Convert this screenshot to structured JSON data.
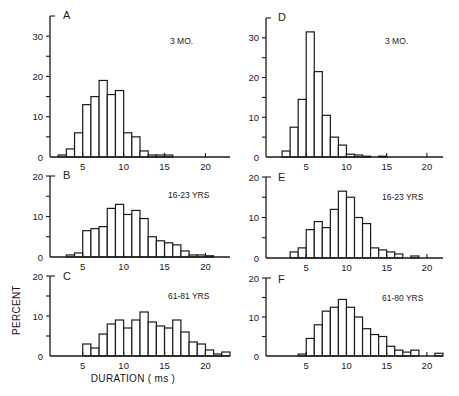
{
  "chart_data": [
    {
      "type": "bar",
      "panel": "A",
      "label": "3 MO.",
      "bin_width": 1,
      "bin_starts": [
        2,
        3,
        4,
        5,
        6,
        7,
        8,
        9,
        10,
        11,
        12,
        13,
        14,
        15
      ],
      "values": [
        0.5,
        2,
        6,
        13,
        15,
        19,
        15.5,
        16.5,
        6,
        5,
        1.5,
        0.5,
        0.5,
        0.5
      ],
      "xlim": [
        1,
        23
      ],
      "ylim": [
        0,
        35
      ],
      "xticks": [
        5,
        10,
        15,
        20
      ],
      "yticks": [
        0,
        10,
        20,
        30
      ],
      "yminor": [
        5,
        15,
        25
      ]
    },
    {
      "type": "bar",
      "panel": "B",
      "label": "16-23 YRS",
      "bin_width": 1,
      "bin_starts": [
        3,
        4,
        5,
        6,
        7,
        8,
        9,
        10,
        11,
        12,
        13,
        14,
        15,
        16,
        17,
        18,
        19,
        20
      ],
      "values": [
        0.5,
        1,
        6.5,
        7,
        7.5,
        12,
        13,
        10.5,
        11.5,
        9.5,
        5,
        4,
        3.5,
        3,
        1.5,
        0.5,
        0.5,
        0.3
      ],
      "xlim": [
        1,
        23
      ],
      "ylim": [
        0,
        20
      ],
      "xticks": [
        5,
        10,
        15,
        20
      ],
      "yticks": [
        0,
        10,
        20
      ],
      "yminor": [
        5,
        15
      ]
    },
    {
      "type": "bar",
      "panel": "C",
      "label": "61-81 YRS",
      "bin_width": 1,
      "bin_starts": [
        5,
        6,
        7,
        8,
        9,
        10,
        11,
        12,
        13,
        14,
        15,
        16,
        17,
        18,
        19,
        20,
        21,
        22
      ],
      "values": [
        3,
        2,
        5.5,
        8,
        9,
        7,
        9,
        11,
        8.5,
        7.5,
        7,
        9,
        6,
        3.5,
        3,
        1.5,
        0.5,
        1
      ],
      "xlim": [
        1,
        23
      ],
      "ylim": [
        0,
        20
      ],
      "xticks": [
        5,
        10,
        15,
        20
      ],
      "yticks": [
        0,
        10,
        20
      ],
      "yminor": [
        5,
        15
      ]
    },
    {
      "type": "bar",
      "panel": "D",
      "label": "3 MO.",
      "bin_width": 1,
      "bin_starts": [
        2,
        3,
        4,
        5,
        6,
        7,
        8,
        9,
        10,
        11,
        12,
        14
      ],
      "values": [
        1.5,
        7.5,
        14.5,
        31.5,
        21.5,
        10.5,
        5,
        3,
        0.7,
        0.5,
        0.2,
        0.2
      ],
      "xlim": [
        0,
        22
      ],
      "ylim": [
        0,
        35
      ],
      "xticks": [
        5,
        10,
        15,
        20
      ],
      "yticks": [
        0,
        10,
        20,
        30
      ],
      "yminor": [
        5,
        15,
        25
      ]
    },
    {
      "type": "bar",
      "panel": "E",
      "label": "16-23 YRS",
      "bin_width": 1,
      "bin_starts": [
        3,
        4,
        5,
        6,
        7,
        8,
        9,
        10,
        11,
        12,
        13,
        14,
        15,
        16,
        18
      ],
      "values": [
        1.5,
        2.5,
        7,
        9,
        7.5,
        12,
        16.5,
        15,
        10,
        8.5,
        2.5,
        2,
        1.5,
        1,
        0.5
      ],
      "xlim": [
        0,
        22
      ],
      "ylim": [
        0,
        20
      ],
      "xticks": [
        5,
        10,
        15,
        20
      ],
      "yticks": [
        0,
        10,
        20
      ],
      "yminor": [
        5,
        15
      ]
    },
    {
      "type": "bar",
      "panel": "F",
      "label": "61-80 YRS",
      "bin_width": 1,
      "bin_starts": [
        4,
        5,
        6,
        7,
        8,
        9,
        10,
        11,
        12,
        13,
        14,
        15,
        16,
        17,
        18,
        21
      ],
      "values": [
        0.5,
        4.5,
        8,
        11.5,
        12.5,
        14.5,
        12.5,
        10,
        7,
        5.5,
        5,
        2.5,
        1.5,
        1,
        1.5,
        0.7
      ],
      "xlim": [
        0,
        22
      ],
      "ylim": [
        0,
        20
      ],
      "xticks": [
        5,
        10,
        15,
        20
      ],
      "yticks": [
        0,
        10,
        20
      ],
      "yminor": [
        5,
        15
      ]
    }
  ],
  "labels": {
    "ylabel": "PERCENT",
    "xlabel": "DURATION ( ms )"
  }
}
